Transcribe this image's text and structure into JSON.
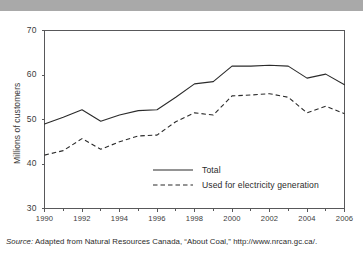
{
  "figure": {
    "title_strip_text": "",
    "source_prefix": "Source:",
    "source_text": "Adapted from Natural Resources Canada, “About Coal,” http://www.nrcan.gc.ca/."
  },
  "chart_data": {
    "type": "line",
    "title": "",
    "xlabel": "",
    "ylabel": "Millions of customers",
    "xlim": [
      1990,
      2006
    ],
    "ylim": [
      30,
      70
    ],
    "yticks": [
      30,
      40,
      50,
      60,
      70
    ],
    "ytick_labels": [
      "30",
      "40",
      "50",
      "60",
      "70"
    ],
    "xticks": [
      1990,
      1992,
      1994,
      1996,
      1998,
      2000,
      2002,
      2004,
      2006
    ],
    "xtick_labels": [
      "1990",
      "1992",
      "1994",
      "1996",
      "1998",
      "2000",
      "2002",
      "2004",
      "2006"
    ],
    "x": [
      1990,
      1991,
      1992,
      1993,
      1994,
      1995,
      1996,
      1997,
      1998,
      1999,
      2000,
      2001,
      2002,
      2003,
      2004,
      2005,
      2006
    ],
    "grid": false,
    "legend_position": "inside-lower-center",
    "series": [
      {
        "name": "Total",
        "style": "solid",
        "color": "#2b2b2b",
        "values": [
          49.0,
          50.5,
          52.2,
          49.6,
          51.0,
          52.0,
          52.2,
          55.0,
          58.0,
          58.5,
          62.0,
          62.0,
          62.2,
          62.0,
          59.3,
          60.2,
          57.8
        ]
      },
      {
        "name": "Used for electricity generation",
        "style": "dashed",
        "color": "#2b2b2b",
        "values": [
          42.0,
          43.0,
          45.7,
          43.3,
          45.0,
          46.3,
          46.5,
          49.5,
          51.5,
          51.0,
          55.3,
          55.5,
          55.8,
          55.0,
          51.5,
          53.0,
          51.3
        ]
      }
    ]
  }
}
